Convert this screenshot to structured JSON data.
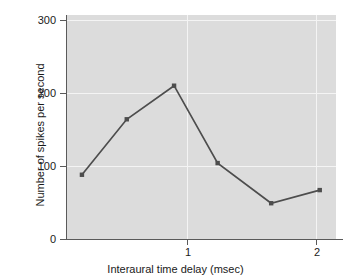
{
  "chart_data": {
    "type": "line",
    "title": "",
    "xlabel": "Interaural time delay (msec)",
    "ylabel": "Number of spikes per second",
    "xlim": [
      0.0,
      2.16
    ],
    "ylim": [
      0,
      307
    ],
    "xticks": [
      1,
      2
    ],
    "xticklabels": [
      "1",
      "2"
    ],
    "yticks": [
      0,
      100,
      200,
      300
    ],
    "yticklabels": [
      "0",
      "100",
      "200",
      "300"
    ],
    "grid": true,
    "grid_color": "#f4f4f4",
    "plot_background": "#dcdcdc",
    "line_color": "#4d4d4d",
    "marker_color": "#4d4d4d",
    "marker": "square",
    "legend": null,
    "x": [
      0.12,
      0.48,
      0.86,
      1.21,
      1.64,
      2.03
    ],
    "values": [
      88,
      164,
      210,
      104,
      49,
      67
    ],
    "series": [
      {
        "name": "Number of spikes per second",
        "x": [
          0.12,
          0.48,
          0.86,
          1.21,
          1.64,
          2.03
        ],
        "values": [
          88,
          164,
          210,
          104,
          49,
          67
        ]
      }
    ]
  },
  "axes": {
    "y_tick_labels": [
      "300",
      "200",
      "100",
      "0"
    ],
    "x_tick_labels": [
      "1",
      "2"
    ],
    "x_title": "Interaural time delay (msec)",
    "y_title": "Number of spikes per second"
  }
}
